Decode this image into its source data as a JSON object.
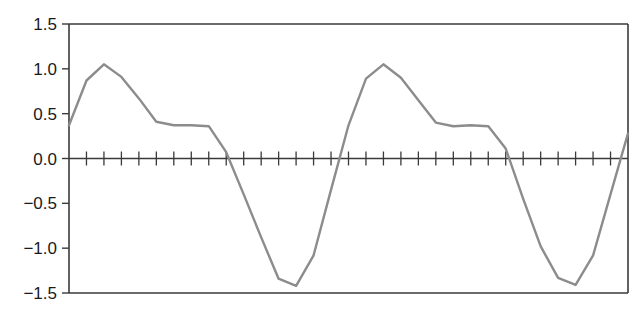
{
  "chart_data": {
    "type": "line",
    "title": "",
    "xlabel": "",
    "ylabel": "",
    "ylim": [
      -1.5,
      1.5
    ],
    "xlim": [
      0,
      32
    ],
    "grid": false,
    "legend": null,
    "y_ticks": [
      1.5,
      1.0,
      0.5,
      0.0,
      -0.5,
      -1.0,
      -1.5
    ],
    "y_tick_labels": [
      "1.5",
      "1.0",
      "0.5",
      "0.0",
      "−0.5",
      "−1.0",
      "−1.5"
    ],
    "x_ticks_on_zero_line": 32,
    "x_tick_labels": [],
    "series": [
      {
        "name": "signal",
        "color": "#8c8c8c",
        "x": [
          0,
          1,
          2,
          3,
          4,
          5,
          6,
          7,
          8,
          9,
          10,
          11,
          12,
          13,
          14,
          15,
          16,
          17,
          18,
          19,
          20,
          21,
          22,
          23,
          24,
          25,
          26,
          27,
          28,
          29,
          30,
          31,
          32
        ],
        "values": [
          0.37,
          0.87,
          1.05,
          0.91,
          0.67,
          0.41,
          0.37,
          0.37,
          0.36,
          0.07,
          -0.4,
          -0.88,
          -1.34,
          -1.42,
          -1.08,
          -0.35,
          0.37,
          0.89,
          1.05,
          0.9,
          0.65,
          0.4,
          0.36,
          0.37,
          0.36,
          0.11,
          -0.45,
          -0.98,
          -1.33,
          -1.41,
          -1.08,
          -0.4,
          0.28
        ]
      }
    ]
  },
  "colors": {
    "axis": "#3a3a3a",
    "line": "#8c8c8c",
    "label": "#1a1a1a"
  }
}
